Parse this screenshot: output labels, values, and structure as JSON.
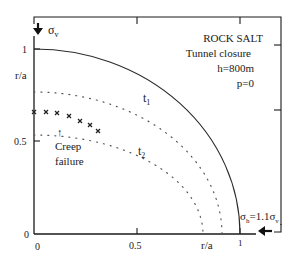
{
  "figure": {
    "title": "ROCK SALT",
    "subtitle": "Tunnel closure",
    "params": [
      "h=800m",
      "p=0"
    ],
    "y_axis": {
      "label": "r/a",
      "ticks": [
        "0",
        "0.5",
        "1"
      ]
    },
    "x_axis": {
      "label": "r/a",
      "ticks": [
        "0",
        "0.5",
        "1"
      ]
    },
    "stress_vertical": {
      "symbol": "σ",
      "subscript": "v"
    },
    "stress_horizontal": {
      "symbol": "σ",
      "subscript": "h",
      "equals": "=1.1",
      "ref_symbol": "σ",
      "ref_subscript": "v"
    },
    "curves": [
      {
        "name": "tunnel-wall",
        "label": "",
        "radius": 1.0,
        "style": "solid"
      },
      {
        "name": "t1",
        "label": "t",
        "label_sub": "1",
        "radius_y": 0.77,
        "radius_x": 0.91,
        "style": "dotted"
      },
      {
        "name": "t2",
        "label": "t",
        "label_sub": "2",
        "radius_y": 0.535,
        "radius_x": 0.82,
        "style": "dotted"
      }
    ],
    "annotation": {
      "line1": "Creep",
      "line2": "failure",
      "arrow": "↑"
    },
    "creep_failure_points": [
      [
        0.0,
        0.66
      ],
      [
        0.06,
        0.66
      ],
      [
        0.11,
        0.65
      ],
      [
        0.17,
        0.64
      ],
      [
        0.22,
        0.61
      ],
      [
        0.27,
        0.59
      ],
      [
        0.31,
        0.56
      ]
    ],
    "colors": {
      "ink": "#1a1a1a",
      "background": "#ffffff"
    }
  }
}
